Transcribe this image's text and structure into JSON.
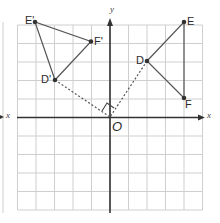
{
  "figure": {
    "type": "coordinate-grid-rotation",
    "colors": {
      "grid": "#cfcfcf",
      "axis": "#333333",
      "shape": "#555555",
      "point": "#333333",
      "construction": "#555555"
    },
    "axes": {
      "x_label": "x",
      "y_label": "y",
      "origin_label": "O"
    },
    "grid": {
      "x_min": -5,
      "x_max": 5,
      "y_min": -5,
      "y_max": 5
    },
    "triangle_original": {
      "points": [
        {
          "name": "D",
          "x": 2,
          "y": 3
        },
        {
          "name": "E",
          "x": 4,
          "y": 5
        },
        {
          "name": "F",
          "x": 4,
          "y": 1
        }
      ]
    },
    "triangle_image": {
      "points": [
        {
          "name": "D'",
          "x": -3,
          "y": 2
        },
        {
          "name": "E'",
          "x": -4,
          "y": 5
        },
        {
          "name": "F'",
          "x": -1,
          "y": 4
        }
      ]
    },
    "construction": {
      "description": "dotted lines from D and D' to origin O with right-angle marker",
      "right_angle_marker": true
    },
    "left_partial_figure": {
      "x_label": "x"
    }
  }
}
